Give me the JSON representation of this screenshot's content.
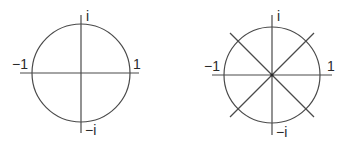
{
  "figure": {
    "stroke_color": "#4a4a4a",
    "label_color": "#2a2a2a",
    "diagrams": [
      {
        "name": "unit-circle-axes",
        "center": [
          81,
          73
        ],
        "radius": 49,
        "axis_extent": {
          "x": [
            20,
            139
          ],
          "y": [
            15,
            133
          ]
        },
        "diagonals": [],
        "labels": {
          "top": "i",
          "left": "−1",
          "right": "1",
          "bottom": "−i"
        }
      },
      {
        "name": "unit-circle-eighth-roots",
        "center": [
          272,
          75
        ],
        "radius": 48,
        "axis_extent": {
          "x": [
            212,
            332
          ],
          "y": [
            15,
            135
          ]
        },
        "diagonals": [
          [
            [
              230,
              33
            ],
            [
              314,
              117
            ]
          ],
          [
            [
              314,
              33
            ],
            [
              230,
              117
            ]
          ]
        ],
        "labels": {
          "top": "i",
          "left": "−1",
          "right": "1",
          "bottom": "−i"
        }
      }
    ]
  }
}
